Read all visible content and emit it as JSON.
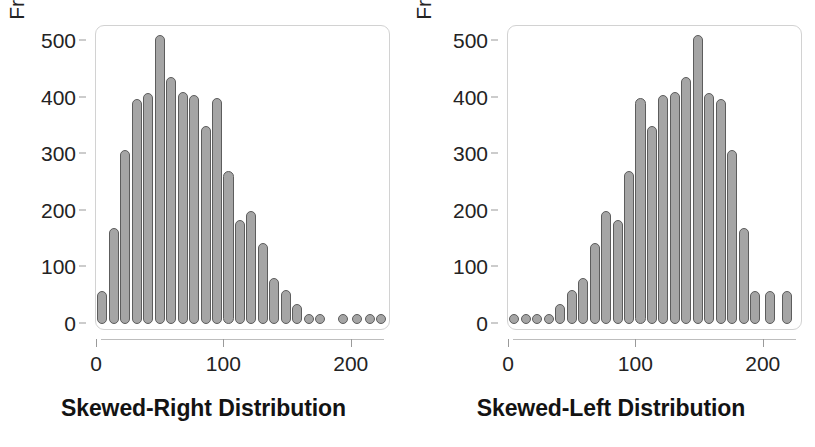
{
  "figure": {
    "background": "#ffffff",
    "bar_fill": "#a5a5a5",
    "bar_stroke": "#5d5d5d",
    "frame_color": "#d2d2d2",
    "text_color": "#232323"
  },
  "panels": [
    {
      "id": "skewed-right",
      "caption": "Skewed-Right Distribution",
      "ylabel": "Frequency",
      "yticks": [
        "0",
        "100",
        "200",
        "300",
        "400",
        "500"
      ],
      "xticks": [
        "0",
        "100",
        "200"
      ]
    },
    {
      "id": "skewed-left",
      "caption": "Skewed-Left Distribution",
      "ylabel": "Frequency",
      "yticks": [
        "0",
        "100",
        "200",
        "300",
        "400",
        "500"
      ],
      "xticks": [
        "0",
        "100",
        "200"
      ]
    }
  ],
  "chart_data": [
    {
      "type": "bar",
      "id": "skewed-right",
      "title": "Skewed-Right Distribution",
      "xlabel": "",
      "ylabel": "Frequency",
      "ylim": [
        0,
        520
      ],
      "xlim": [
        0,
        230
      ],
      "grid": false,
      "legend": null,
      "bin_width": 9,
      "categories": [
        5,
        14,
        23,
        32,
        41,
        50,
        59,
        68,
        77,
        86,
        95,
        104,
        113,
        122,
        131,
        140,
        149,
        158,
        167,
        176,
        194,
        205,
        215,
        224
      ],
      "values": [
        58,
        170,
        307,
        397,
        408,
        510,
        437,
        410,
        405,
        350,
        400,
        270,
        183,
        200,
        143,
        82,
        60,
        35,
        12,
        10,
        10,
        10,
        10,
        10
      ],
      "xtick_values": [
        0,
        100,
        200
      ],
      "ytick_values": [
        0,
        100,
        200,
        300,
        400,
        500
      ]
    },
    {
      "type": "bar",
      "id": "skewed-left",
      "title": "Skewed-Left Distribution",
      "xlabel": "",
      "ylabel": "Frequency",
      "ylim": [
        0,
        520
      ],
      "xlim": [
        0,
        230
      ],
      "grid": false,
      "legend": null,
      "bin_width": 9,
      "categories": [
        5,
        14,
        23,
        32,
        41,
        50,
        59,
        68,
        77,
        86,
        95,
        104,
        113,
        122,
        131,
        140,
        149,
        158,
        167,
        176,
        185,
        194,
        206,
        219
      ],
      "values": [
        10,
        10,
        10,
        12,
        35,
        60,
        82,
        143,
        200,
        183,
        270,
        400,
        350,
        405,
        410,
        437,
        510,
        408,
        397,
        307,
        170,
        58,
        58,
        58
      ],
      "xtick_values": [
        0,
        100,
        200
      ],
      "ytick_values": [
        0,
        100,
        200,
        300,
        400,
        500
      ]
    }
  ]
}
